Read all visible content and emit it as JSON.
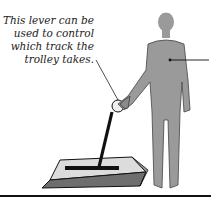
{
  "diagram": {
    "caption_lines": [
      "This lever can be",
      "used to control",
      "which track the",
      "trolley takes."
    ],
    "elements": {
      "person": "standing-person-figure",
      "lever": "track-switch-lever",
      "lever_base": "lever-base-block",
      "pointer_line": "label-pointer-to-person",
      "caption_pointer": "label-pointer-to-lever",
      "ground_line": "ground-line"
    },
    "colors": {
      "person_fill": "#9a9a9a",
      "base_top": "#d8d8d8",
      "base_side": "#6e6e6e",
      "line": "#111111"
    }
  }
}
